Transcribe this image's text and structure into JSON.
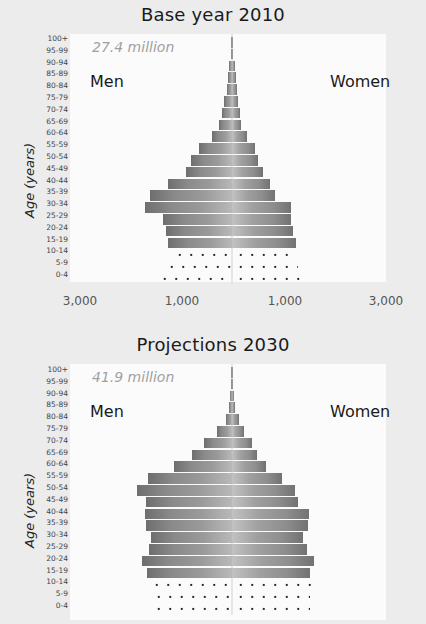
{
  "chart_data": [
    {
      "type": "bar",
      "subtype": "population-pyramid",
      "title": "Base year 2010",
      "total_label": "27.4 million",
      "left_label": "Men",
      "right_label": "Women",
      "ylabel": "Age (years)",
      "xlabel": "",
      "x_tick_labels": [
        "3,000",
        "1,000",
        "1,000",
        "3,000"
      ],
      "x_unit_note": "thousands, mirrored about center",
      "xlim": [
        -3000,
        3000
      ],
      "grid": false,
      "categories": [
        "100+",
        "95-99",
        "90-94",
        "85-89",
        "80-84",
        "75-79",
        "70-74",
        "65-69",
        "60-64",
        "55-59",
        "50-54",
        "45-49",
        "40-44",
        "35-39",
        "30-34",
        "25-29",
        "20-24",
        "15-19",
        "10-14",
        "5-9",
        "0-4"
      ],
      "series": [
        {
          "name": "Men",
          "values": [
            10,
            20,
            50,
            80,
            100,
            150,
            200,
            250,
            400,
            650,
            800,
            900,
            1250,
            1600,
            1700,
            1350,
            1300,
            1250,
            1200,
            1350,
            1500
          ]
        },
        {
          "name": "Women",
          "values": [
            10,
            20,
            50,
            80,
            100,
            120,
            150,
            180,
            300,
            450,
            500,
            600,
            750,
            850,
            1150,
            1150,
            1200,
            1250,
            1200,
            1300,
            1450
          ]
        }
      ],
      "dotted_categories": [
        "10-14",
        "5-9",
        "0-4"
      ]
    },
    {
      "type": "bar",
      "subtype": "population-pyramid",
      "title": "Projections 2030",
      "total_label": "41.9 million",
      "left_label": "Men",
      "right_label": "Women",
      "ylabel": "Age (years)",
      "xlabel": "",
      "x_tick_labels": [],
      "xlim": [
        -3000,
        3000
      ],
      "grid": false,
      "categories": [
        "100+",
        "95-99",
        "90-94",
        "85-89",
        "80-84",
        "75-79",
        "70-74",
        "65-69",
        "60-64",
        "55-59",
        "50-54",
        "45-49",
        "40-44",
        "35-39",
        "30-34",
        "25-29",
        "20-24",
        "15-19",
        "10-14",
        "5-9",
        "0-4"
      ],
      "series": [
        {
          "name": "Men",
          "values": [
            10,
            20,
            40,
            60,
            120,
            290,
            550,
            780,
            1130,
            1650,
            1870,
            1690,
            1700,
            1690,
            1590,
            1630,
            1760,
            1670,
            1650,
            1600,
            1600
          ]
        },
        {
          "name": "Women",
          "values": [
            10,
            20,
            40,
            60,
            140,
            240,
            390,
            490,
            670,
            980,
            1230,
            1290,
            1510,
            1490,
            1390,
            1470,
            1610,
            1530,
            1560,
            1520,
            1520
          ]
        }
      ],
      "dotted_categories": [
        "10-14",
        "5-9",
        "0-4"
      ]
    }
  ],
  "panels": [
    {
      "title": "Base year 2010",
      "total": "27.4 million",
      "men": "Men",
      "women": "Women",
      "ylabel": "Age (years)",
      "xticks": [
        "3,000",
        "1,000",
        "1,000",
        "3,000"
      ]
    },
    {
      "title": "Projections 2030",
      "total": "41.9 million",
      "men": "Men",
      "women": "Women",
      "ylabel": "Age (years)"
    }
  ],
  "age_groups": [
    "100+",
    "95-99",
    "90-94",
    "85-89",
    "80-84",
    "75-79",
    "70-74",
    "65-69",
    "60-64",
    "55-59",
    "50-54",
    "45-49",
    "40-44",
    "35-39",
    "30-34",
    "25-29",
    "20-24",
    "15-19",
    "10-14",
    "5-9",
    "0-4"
  ]
}
